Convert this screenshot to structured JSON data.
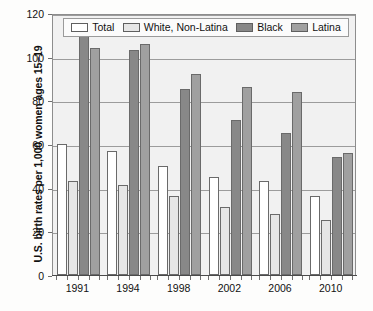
{
  "chart_data": {
    "type": "bar",
    "title": "",
    "xlabel": "",
    "ylabel": "U.S. birth rates per 1,000 women ages 15–19",
    "categories": [
      "1991",
      "1994",
      "1998",
      "2002",
      "2006",
      "2010"
    ],
    "ylim": [
      0,
      120
    ],
    "yticks": [
      "0",
      "20",
      "40",
      "60",
      "80",
      "100",
      "120"
    ],
    "ytick_values": [
      0,
      20,
      40,
      60,
      80,
      100,
      120
    ],
    "grid": "horizontal",
    "legend_position": "top-inside",
    "series": [
      {
        "name": "Total",
        "color": "#ffffff",
        "values": [
          60,
          57,
          50,
          45,
          43,
          36
        ]
      },
      {
        "name": "White, Non-Latina",
        "color": "#e6e6e6",
        "values": [
          43,
          41,
          36,
          31,
          28,
          25
        ]
      },
      {
        "name": "Black",
        "color": "#888888",
        "values": [
          114,
          103,
          85,
          71,
          65,
          54
        ]
      },
      {
        "name": "Latina",
        "color": "#a0a0a0",
        "values": [
          104,
          106,
          92,
          86,
          84,
          56
        ]
      }
    ]
  },
  "colors": {
    "plot_background": "#f1f1f1",
    "gridline": "#9c9c9c",
    "frame": "#8d8d8d",
    "bar_outline": "#6a6a6a",
    "text": "#111111"
  }
}
